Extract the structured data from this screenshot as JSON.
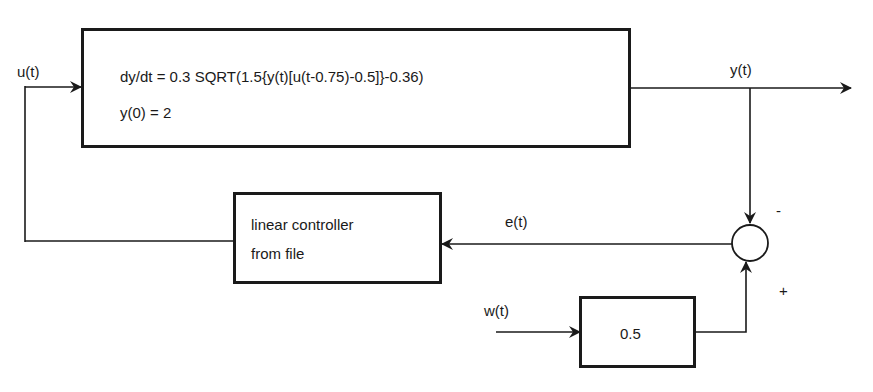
{
  "diagram": {
    "type": "block-diagram",
    "signals": {
      "input": "u(t)",
      "output": "y(t)",
      "error": "e(t)",
      "disturbance": "w(t)"
    },
    "blocks": {
      "plant": {
        "line1": "dy/dt = 0.3 SQRT(1.5{y(t)[u(t-0.75)-0.5]}-0.36)",
        "line2": "y(0) = 2"
      },
      "controller": {
        "line1": "linear controller",
        "line2": "from file"
      },
      "gain": {
        "value": "0.5"
      }
    },
    "summing_junction": {
      "top_sign": "-",
      "bottom_sign": "+"
    },
    "colors": {
      "stroke": "#1a1a1a",
      "background": "#ffffff"
    }
  }
}
